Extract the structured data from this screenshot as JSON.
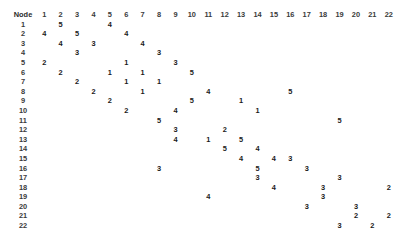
{
  "panel": {
    "corner_header": "Node",
    "text_color": "#1a1a1a",
    "header_color": "#3a3a3a",
    "background": "#ffffff"
  },
  "columns": [
    "1",
    "2",
    "3",
    "4",
    "5",
    "6",
    "7",
    "8",
    "9",
    "10",
    "11",
    "12",
    "13",
    "14",
    "15",
    "16",
    "17",
    "18",
    "19",
    "20",
    "21",
    "22"
  ],
  "rows": [
    "1",
    "2",
    "3",
    "4",
    "5",
    "6",
    "7",
    "8",
    "9",
    "10",
    "11",
    "12",
    "13",
    "14",
    "15",
    "16",
    "17",
    "18",
    "19",
    "20",
    "21",
    "22"
  ],
  "chart_data": {
    "type": "table",
    "title": "Node",
    "xlabel": "Node",
    "ylabel": "Node",
    "categories": [
      "1",
      "2",
      "3",
      "4",
      "5",
      "6",
      "7",
      "8",
      "9",
      "10",
      "11",
      "12",
      "13",
      "14",
      "15",
      "16",
      "17",
      "18",
      "19",
      "20",
      "21",
      "22"
    ],
    "row_categories": [
      "1",
      "2",
      "3",
      "4",
      "5",
      "6",
      "7",
      "8",
      "9",
      "10",
      "11",
      "12",
      "13",
      "14",
      "15",
      "16",
      "17",
      "18",
      "19",
      "20",
      "21",
      "22"
    ],
    "grid": false,
    "legend": "none",
    "matrix": [
      [
        "",
        "5",
        "",
        "",
        "4",
        "",
        "",
        "",
        "",
        "",
        "",
        "",
        "",
        "",
        "",
        "",
        "",
        "",
        "",
        "",
        "",
        ""
      ],
      [
        "4",
        "",
        "5",
        "",
        "",
        "4",
        "",
        "",
        "",
        "",
        "",
        "",
        "",
        "",
        "",
        "",
        "",
        "",
        "",
        "",
        "",
        ""
      ],
      [
        "",
        "4",
        "",
        "3",
        "",
        "",
        "4",
        "",
        "",
        "",
        "",
        "",
        "",
        "",
        "",
        "",
        "",
        "",
        "",
        "",
        "",
        ""
      ],
      [
        "",
        "",
        "3",
        "",
        "",
        "",
        "",
        "3",
        "",
        "",
        "",
        "",
        "",
        "",
        "",
        "",
        "",
        "",
        "",
        "",
        "",
        ""
      ],
      [
        "2",
        "",
        "",
        "",
        "",
        "1",
        "",
        "",
        "3",
        "",
        "",
        "",
        "",
        "",
        "",
        "",
        "",
        "",
        "",
        "",
        "",
        ""
      ],
      [
        "",
        "2",
        "",
        "",
        "1",
        "",
        "1",
        "",
        "",
        "5",
        "",
        "",
        "",
        "",
        "",
        "",
        "",
        "",
        "",
        "",
        "",
        ""
      ],
      [
        "",
        "",
        "2",
        "",
        "",
        "1",
        "",
        "1",
        "",
        "",
        "",
        "",
        "",
        "",
        "",
        "",
        "",
        "",
        "",
        "",
        "",
        ""
      ],
      [
        "",
        "",
        "",
        "2",
        "",
        "",
        "1",
        "",
        "",
        "",
        "4",
        "",
        "",
        "",
        "",
        "5",
        "",
        "",
        "",
        "",
        "",
        ""
      ],
      [
        "",
        "",
        "",
        "",
        "2",
        "",
        "",
        "",
        "",
        "5",
        "",
        "",
        "1",
        "",
        "",
        "",
        "",
        "",
        "",
        "",
        "",
        ""
      ],
      [
        "",
        "",
        "",
        "",
        "",
        "2",
        "",
        "",
        "4",
        "",
        "",
        "",
        "",
        "1",
        "",
        "",
        "",
        "",
        "",
        "",
        "",
        ""
      ],
      [
        "",
        "",
        "",
        "",
        "",
        "",
        "",
        "5",
        "",
        "",
        "",
        "",
        "",
        "",
        "",
        "",
        "",
        "",
        "5",
        "",
        "",
        ""
      ],
      [
        "",
        "",
        "",
        "",
        "",
        "",
        "",
        "",
        "3",
        "",
        "",
        "2",
        "",
        "",
        "",
        "",
        "",
        "",
        "",
        "",
        "",
        ""
      ],
      [
        "",
        "",
        "",
        "",
        "",
        "",
        "",
        "",
        "4",
        "",
        "1",
        "",
        "5",
        "",
        "",
        "",
        "",
        "",
        "",
        "",
        "",
        ""
      ],
      [
        "",
        "",
        "",
        "",
        "",
        "",
        "",
        "",
        "",
        "",
        "",
        "5",
        "",
        "4",
        "",
        "",
        "",
        "",
        "",
        "",
        "",
        ""
      ],
      [
        "",
        "",
        "",
        "",
        "",
        "",
        "",
        "",
        "",
        "",
        "",
        "",
        "4",
        "",
        "4",
        "3",
        "",
        "",
        "",
        "",
        "",
        ""
      ],
      [
        "",
        "",
        "",
        "",
        "",
        "",
        "",
        "3",
        "",
        "",
        "",
        "",
        "",
        "5",
        "",
        "",
        "3",
        "",
        "",
        "",
        "",
        ""
      ],
      [
        "",
        "",
        "",
        "",
        "",
        "",
        "",
        "",
        "",
        "",
        "",
        "",
        "",
        "3",
        "",
        "",
        "",
        "",
        "3",
        "",
        "",
        ""
      ],
      [
        "",
        "",
        "",
        "",
        "",
        "",
        "",
        "",
        "",
        "",
        "",
        "",
        "",
        "",
        "4",
        "",
        "",
        "3",
        "",
        "",
        "",
        "2"
      ],
      [
        "",
        "",
        "",
        "",
        "",
        "",
        "",
        "",
        "",
        "",
        "4",
        "",
        "",
        "",
        "",
        "",
        "",
        "3",
        "",
        "",
        "",
        ""
      ],
      [
        "",
        "",
        "",
        "",
        "",
        "",
        "",
        "",
        "",
        "",
        "",
        "",
        "",
        "",
        "",
        "",
        "3",
        "",
        "",
        "3",
        "",
        ""
      ],
      [
        "",
        "",
        "",
        "",
        "",
        "",
        "",
        "",
        "",
        "",
        "",
        "",
        "",
        "",
        "",
        "",
        "",
        "",
        "",
        "2",
        "",
        "2"
      ],
      [
        "",
        "",
        "",
        "",
        "",
        "",
        "",
        "",
        "",
        "",
        "",
        "",
        "",
        "",
        "",
        "",
        "",
        "",
        "3",
        "",
        "2",
        ""
      ]
    ]
  }
}
